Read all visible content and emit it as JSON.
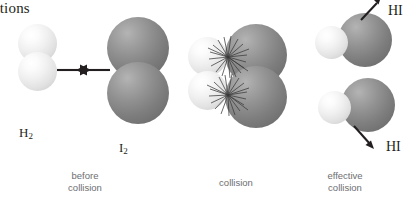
{
  "figure": {
    "heading_fragment": "actions",
    "background_color": "#ffffff",
    "width": 412,
    "height": 205
  },
  "colors": {
    "hydrogen_sphere": "#e8e8e8",
    "iodine_sphere": "#7e7e7e",
    "arrow": "#231f20",
    "caption_text": "#6d6e71",
    "label_text": "#231f20"
  },
  "panels": [
    {
      "id": "before-collision",
      "caption": "before\ncollision",
      "molecules": [
        {
          "id": "h2",
          "label": "H",
          "subscript": "2",
          "element": "hydrogen",
          "atom_count": 2
        },
        {
          "id": "i2",
          "label": "I",
          "subscript": "2",
          "element": "iodine",
          "atom_count": 2
        }
      ],
      "arrows": [
        {
          "id": "arrow-right",
          "direction": "right"
        },
        {
          "id": "arrow-left",
          "direction": "left"
        }
      ]
    },
    {
      "id": "collision",
      "caption": "collision",
      "molecules": [
        {
          "id": "h2-colliding",
          "element": "hydrogen",
          "atom_count": 2
        },
        {
          "id": "i2-colliding",
          "element": "iodine",
          "atom_count": 2
        }
      ],
      "effects": [
        "spark-burst-upper",
        "spark-burst-lower"
      ]
    },
    {
      "id": "effective-collision",
      "caption": "effective\ncollision",
      "molecules": [
        {
          "id": "hi-upper",
          "label": "HI",
          "element": "hydrogen-iodide",
          "atom_count": 2
        },
        {
          "id": "hi-lower",
          "label": "HI",
          "element": "hydrogen-iodide",
          "atom_count": 2
        }
      ],
      "arrows": [
        {
          "id": "arrow-hi-upper",
          "direction": "up-right"
        },
        {
          "id": "arrow-hi-lower",
          "direction": "down-right"
        }
      ],
      "product_labels": [
        {
          "id": "hi-label-top",
          "text": "HI"
        },
        {
          "id": "hi-label-bottom",
          "text": "HI"
        }
      ]
    }
  ],
  "labels": {
    "h2": "H",
    "h2_sub": "2",
    "i2": "I",
    "i2_sub": "2",
    "hi_top": "HI",
    "hi_bottom": "HI"
  },
  "captions": {
    "before_collision": "before\ncollision",
    "collision": "collision",
    "effective_collision": "effective\ncollision"
  }
}
